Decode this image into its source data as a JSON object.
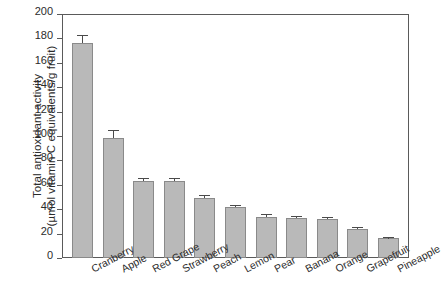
{
  "chart_data": {
    "type": "bar",
    "title": "",
    "xlabel": "",
    "ylabel_line1": "Total antioxidant activity",
    "ylabel_line2": "(µmol vitamin C equivalents/g fruit)",
    "ylim": [
      0,
      200
    ],
    "yticks": [
      0,
      20,
      40,
      60,
      80,
      100,
      120,
      140,
      160,
      180,
      200
    ],
    "grid": false,
    "legend": "none",
    "categories": [
      "Cranberry",
      "Apple",
      "Red Grape",
      "Strawberry",
      "Peach",
      "Lemon",
      "Pear",
      "Banana",
      "Orange",
      "Grapefruit",
      "Pineapple"
    ],
    "values": [
      176,
      98,
      63,
      63,
      49,
      42,
      34,
      33,
      32,
      24,
      16
    ],
    "errors": [
      6,
      6,
      2,
      2,
      1.5,
      1,
      1,
      1,
      1,
      1,
      0.8
    ],
    "bar_color": "#b9b9b9",
    "bar_edge_color": "#8a8a8a",
    "axis_color": "#5a5a5a"
  }
}
